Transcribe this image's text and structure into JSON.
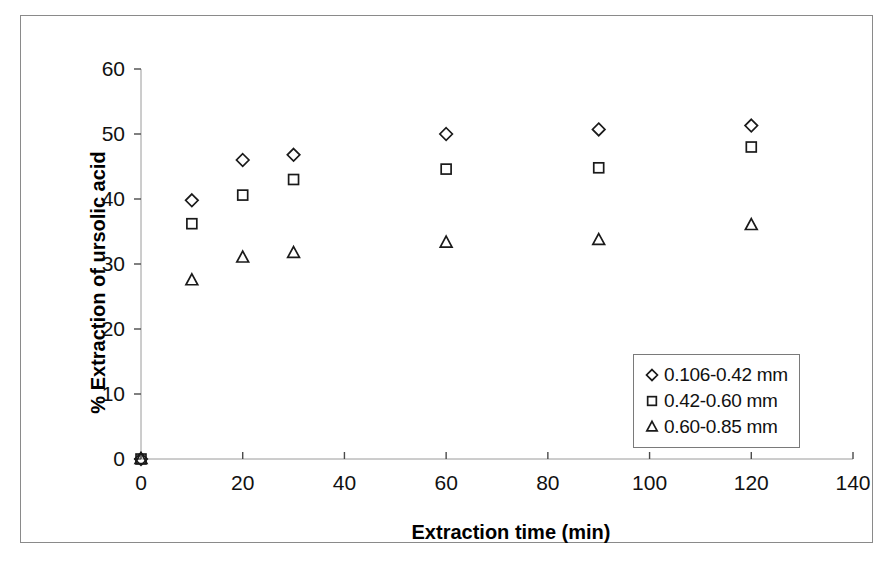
{
  "chart_data": {
    "type": "scatter",
    "title": "",
    "xlabel": "Extraction time (min)",
    "ylabel": "% Extraction of ursolic acid",
    "xlim": [
      0,
      140
    ],
    "ylim": [
      0,
      60
    ],
    "xticks": [
      "0",
      "20",
      "40",
      "60",
      "80",
      "100",
      "120",
      "140"
    ],
    "yticks": [
      "0",
      "10",
      "20",
      "30",
      "40",
      "50",
      "60"
    ],
    "grid": false,
    "legend_position": "inside-lower-right",
    "x": [
      0,
      10,
      20,
      30,
      60,
      90,
      120
    ],
    "series": [
      {
        "name": "0.106-0.42 mm",
        "marker": "diamond",
        "color": "#1a1a1a",
        "values": [
          0,
          39.8,
          46.0,
          46.8,
          50.0,
          50.7,
          51.3
        ]
      },
      {
        "name": "0.42-0.60 mm",
        "marker": "square",
        "color": "#1a1a1a",
        "values": [
          0,
          36.2,
          40.6,
          43.0,
          44.6,
          44.8,
          48.0
        ]
      },
      {
        "name": "0.60-0.85 mm",
        "marker": "triangle",
        "color": "#1a1a1a",
        "values": [
          0,
          27.5,
          31.0,
          31.7,
          33.3,
          33.7,
          36.0
        ]
      }
    ]
  },
  "legend": {
    "items": [
      {
        "label": "0.106-0.42 mm",
        "marker": "diamond"
      },
      {
        "label": "0.42-0.60 mm",
        "marker": "square"
      },
      {
        "label": "0.60-0.85 mm",
        "marker": "triangle"
      }
    ]
  },
  "axes": {
    "x_title": "Extraction time (min)",
    "y_title": "% Extraction of ursolic acid"
  }
}
